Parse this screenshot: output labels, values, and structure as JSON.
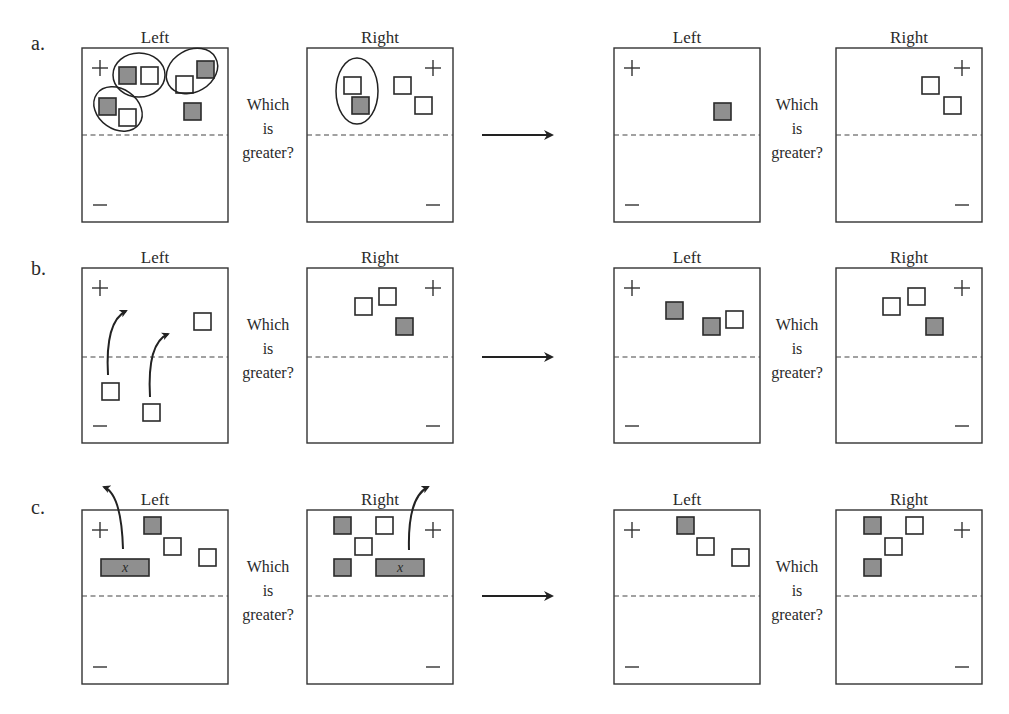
{
  "figure": {
    "question": [
      "Which",
      "is",
      "greater?"
    ],
    "side_labels": {
      "left": "Left",
      "right": "Right"
    },
    "sign_labels": {
      "plus": "+",
      "minus": "—"
    },
    "colors": {
      "tile_filled": "#8f8f8f",
      "tile_empty": "#ffffff",
      "stroke": "#333333"
    },
    "rows": [
      {
        "id": "a",
        "label": "a.",
        "description": "Remove zero pairs",
        "before": {
          "left": {
            "positive_tiles": [
              {
                "type": "neg"
              },
              {
                "type": "pos"
              },
              {
                "type": "pos"
              },
              {
                "type": "neg"
              },
              {
                "type": "neg"
              },
              {
                "type": "pos"
              },
              {
                "type": "neg"
              }
            ],
            "zero_pair_circles": 3,
            "negative_tiles": []
          },
          "right": {
            "positive_tiles": [
              {
                "type": "pos"
              },
              {
                "type": "neg"
              },
              {
                "type": "pos"
              },
              {
                "type": "pos"
              }
            ],
            "zero_pair_circles": 1,
            "negative_tiles": []
          }
        },
        "after": {
          "left": {
            "positive_tiles": [
              {
                "type": "neg"
              }
            ],
            "negative_tiles": []
          },
          "right": {
            "positive_tiles": [
              {
                "type": "pos"
              },
              {
                "type": "pos"
              }
            ],
            "negative_tiles": []
          }
        }
      },
      {
        "id": "b",
        "label": "b.",
        "description": "Move tiles from negative region to positive region (flipping sign)",
        "before": {
          "left": {
            "positive_tiles": [
              {
                "type": "pos"
              }
            ],
            "negative_tiles": [
              {
                "type": "pos"
              },
              {
                "type": "pos"
              }
            ],
            "move_arrows": 2
          },
          "right": {
            "positive_tiles": [
              {
                "type": "pos"
              },
              {
                "type": "pos"
              },
              {
                "type": "neg"
              }
            ],
            "negative_tiles": []
          }
        },
        "after": {
          "left": {
            "positive_tiles": [
              {
                "type": "neg"
              },
              {
                "type": "neg"
              },
              {
                "type": "pos"
              }
            ],
            "negative_tiles": []
          },
          "right": {
            "positive_tiles": [
              {
                "type": "pos"
              },
              {
                "type": "pos"
              },
              {
                "type": "neg"
              }
            ],
            "negative_tiles": []
          }
        }
      },
      {
        "id": "c",
        "label": "c.",
        "description": "Remove equal x-tiles from both sides",
        "before": {
          "left": {
            "positive_tiles": [
              {
                "type": "neg"
              },
              {
                "type": "pos"
              },
              {
                "type": "pos"
              }
            ],
            "x_tile": "x",
            "negative_tiles": [],
            "remove_arrow": true
          },
          "right": {
            "positive_tiles": [
              {
                "type": "neg"
              },
              {
                "type": "pos"
              },
              {
                "type": "pos"
              },
              {
                "type": "neg"
              }
            ],
            "x_tile": "x",
            "negative_tiles": [],
            "remove_arrow": true
          }
        },
        "after": {
          "left": {
            "positive_tiles": [
              {
                "type": "neg"
              },
              {
                "type": "pos"
              },
              {
                "type": "pos"
              }
            ],
            "negative_tiles": []
          },
          "right": {
            "positive_tiles": [
              {
                "type": "neg"
              },
              {
                "type": "pos"
              },
              {
                "type": "pos"
              },
              {
                "type": "neg"
              }
            ],
            "negative_tiles": []
          }
        }
      }
    ]
  }
}
